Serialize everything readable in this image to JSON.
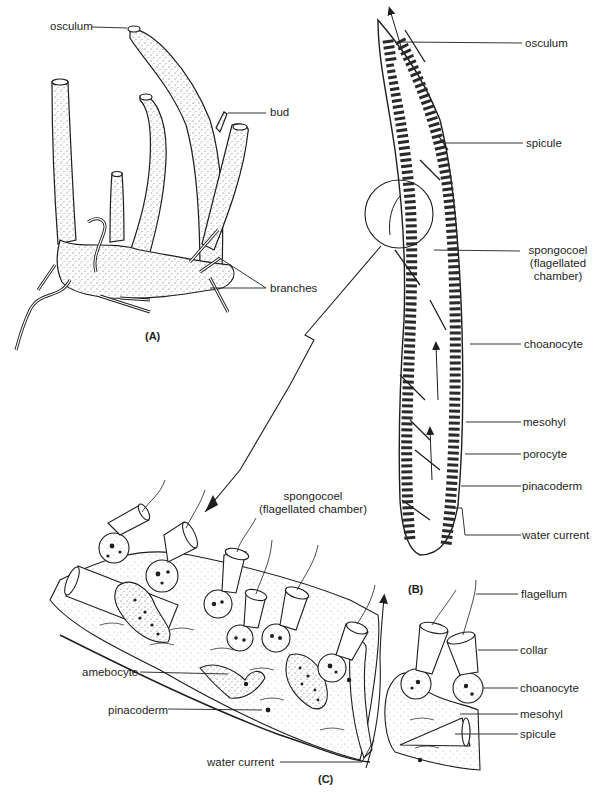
{
  "figure": {
    "panels": {
      "a": "(A)",
      "b": "(B)",
      "c": "(C)"
    },
    "panel_a": {
      "labels": {
        "osculum": "osculum",
        "bud": "bud",
        "branches": "branches"
      }
    },
    "panel_b": {
      "labels": {
        "osculum": "osculum",
        "spicule": "spicule",
        "spongocoel_line1": "spongocoel",
        "spongocoel_line2": "(flagellated",
        "spongocoel_line3": "chamber)",
        "choanocyte": "choanocyte",
        "mesohyl": "mesohyl",
        "porocyte": "porocyte",
        "pinacoderm": "pinacoderm",
        "water_current": "water current"
      }
    },
    "panel_c": {
      "labels": {
        "spongocoel_line1": "spongocoel",
        "spongocoel_line2": "(flagellated chamber)",
        "flagellum": "flagellum",
        "collar": "collar",
        "choanocyte": "choanocyte",
        "mesohyl": "mesohyl",
        "spicule": "spicule",
        "amebocyte": "amebocyte",
        "pinacoderm": "pinacoderm",
        "water_current": "water current"
      }
    },
    "colors": {
      "ink": "#1e1e1e",
      "paper": "#ffffff",
      "stipple": "#cfcfcf"
    }
  }
}
